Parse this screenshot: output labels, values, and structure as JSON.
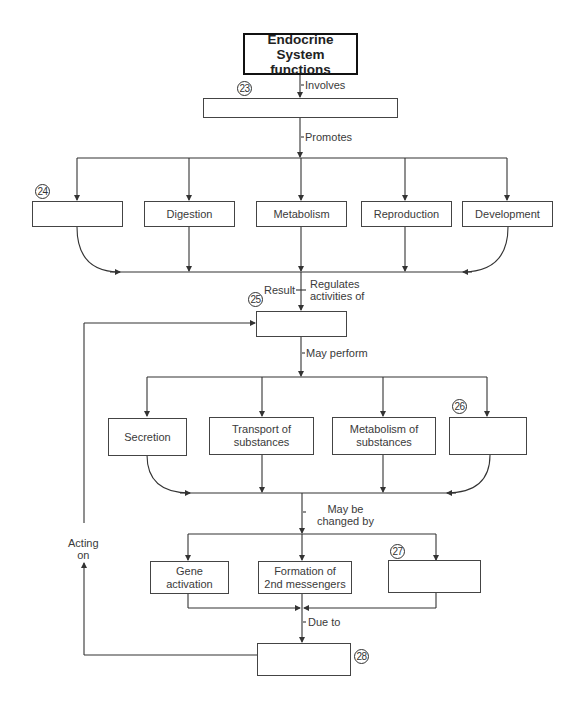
{
  "title": {
    "line1": "Endocrine System",
    "line2": "functions"
  },
  "edges": {
    "involves": "Involves",
    "promotes": "Promotes",
    "result": "Result",
    "regulates_line1": "Regulates",
    "regulates_line2": "activities of",
    "may_perform": "May perform",
    "may_be_changed_line1": "May be",
    "may_be_changed_line2": "changed by",
    "due_to": "Due to",
    "acting_on_line1": "Acting",
    "acting_on_line2": "on"
  },
  "blanks": {
    "b23": {
      "number": "23",
      "value": ""
    },
    "b24": {
      "number": "24",
      "value": ""
    },
    "b25": {
      "number": "25",
      "value": ""
    },
    "b26": {
      "number": "26",
      "value": ""
    },
    "b27": {
      "number": "27",
      "value": ""
    },
    "b28": {
      "number": "28",
      "value": ""
    }
  },
  "promotes_row": [
    "",
    "Digestion",
    "Metabolism",
    "Reproduction",
    "Development"
  ],
  "perform_row": [
    {
      "line1": "Secretion",
      "line2": ""
    },
    {
      "line1": "Transport of",
      "line2": "substances"
    },
    {
      "line1": "Metabolism of",
      "line2": "substances"
    },
    {
      "line1": "",
      "line2": ""
    }
  ],
  "changed_row": [
    {
      "line1": "Gene",
      "line2": "activation"
    },
    {
      "line1": "Formation of",
      "line2": "2nd messengers"
    },
    {
      "line1": "",
      "line2": ""
    }
  ],
  "colors": {
    "line": "#333333",
    "title_border": "#111111",
    "box_border": "#444444"
  }
}
